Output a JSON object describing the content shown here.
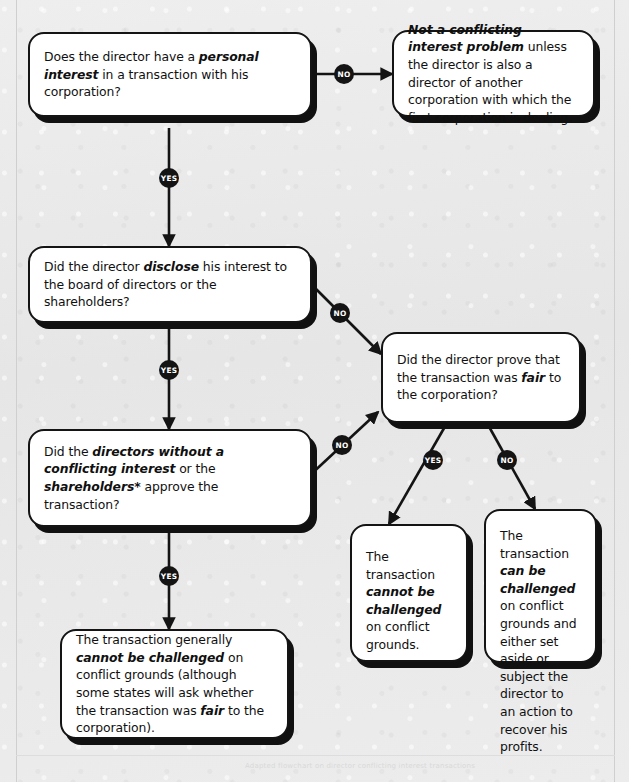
{
  "diagram": {
    "background_color": "#e9e9e9",
    "node_fill": "#ffffff",
    "node_stroke": "#141414",
    "badge_fill": "#141414",
    "badge_text_color": "#ffffff"
  },
  "nodes": [
    {
      "id": "q1",
      "type": "decision",
      "segments": [
        {
          "text": "Does the director have a ",
          "bold": false
        },
        {
          "text": "personal interest",
          "bold": true
        },
        {
          "text": " in a transaction with his corporation?",
          "bold": false
        }
      ],
      "plain": "Does the director have a personal interest in a transaction with his corporation?"
    },
    {
      "id": "r1",
      "type": "outcome",
      "segments": [
        {
          "text": "Not a conflicting interest problem",
          "bold": true
        },
        {
          "text": " unless the director is also a director of another corporation with which the first corporation is dealing.",
          "bold": false
        }
      ],
      "plain": "Not a conflicting interest problem unless the director is also a director of another corporation with which the first corporation is dealing."
    },
    {
      "id": "q2",
      "type": "decision",
      "segments": [
        {
          "text": "Did the director ",
          "bold": false
        },
        {
          "text": "disclose",
          "bold": true
        },
        {
          "text": " his interest to the board of directors or the shareholders?",
          "bold": false
        }
      ],
      "plain": "Did the director disclose his interest to the board of directors or the shareholders?"
    },
    {
      "id": "q3",
      "type": "decision",
      "segments": [
        {
          "text": "Did the director prove that the transaction was ",
          "bold": false
        },
        {
          "text": "fair",
          "bold": true
        },
        {
          "text": " to the corporation?",
          "bold": false
        }
      ],
      "plain": "Did the director prove that the transaction was fair to the corporation?"
    },
    {
      "id": "q4",
      "type": "decision",
      "segments": [
        {
          "text": "Did the ",
          "bold": false
        },
        {
          "text": "directors without a conflicting interest",
          "bold": true
        },
        {
          "text": " or the ",
          "bold": false
        },
        {
          "text": "shareholders*",
          "bold": true
        },
        {
          "text": " approve the transaction?",
          "bold": false
        }
      ],
      "plain": "Did the directors without a conflicting interest or the shareholders* approve the transaction?"
    },
    {
      "id": "r2",
      "type": "outcome",
      "segments": [
        {
          "text": "The transaction ",
          "bold": false
        },
        {
          "text": "cannot be challenged",
          "bold": true
        },
        {
          "text": " on conflict grounds.",
          "bold": false
        }
      ],
      "plain": "The transaction cannot be challenged on conflict grounds."
    },
    {
      "id": "r3",
      "type": "outcome",
      "segments": [
        {
          "text": "The transaction ",
          "bold": false
        },
        {
          "text": "can be challenged",
          "bold": true
        },
        {
          "text": " on conflict grounds and either set aside or subject the director to an action to recover his profits.",
          "bold": false
        }
      ],
      "plain": "The transaction can be challenged on conflict grounds and either set aside or subject the director to an action to recover his profits."
    },
    {
      "id": "r4",
      "type": "outcome",
      "segments": [
        {
          "text": "The transaction generally ",
          "bold": false
        },
        {
          "text": "cannot be challenged",
          "bold": true
        },
        {
          "text": " on conflict grounds (although some states will ask whether the transaction was ",
          "bold": false
        },
        {
          "text": "fair",
          "bold": true
        },
        {
          "text": " to the corporation).",
          "bold": false
        }
      ],
      "plain": "The transaction generally cannot be challenged on conflict grounds (although some states will ask whether the transaction was fair to the corporation)."
    }
  ],
  "edges": [
    {
      "id": "e1",
      "from": "q1",
      "to": "r1",
      "label": "NO"
    },
    {
      "id": "e2",
      "from": "q1",
      "to": "q2",
      "label": "YES"
    },
    {
      "id": "e3",
      "from": "q2",
      "to": "q3",
      "label": "NO"
    },
    {
      "id": "e4",
      "from": "q2",
      "to": "q4",
      "label": "YES"
    },
    {
      "id": "e5",
      "from": "q4",
      "to": "q3",
      "label": "NO"
    },
    {
      "id": "e6",
      "from": "q4",
      "to": "r4",
      "label": "YES"
    },
    {
      "id": "e7",
      "from": "q3",
      "to": "r2",
      "label": "YES"
    },
    {
      "id": "e8",
      "from": "q3",
      "to": "r3",
      "label": "NO"
    }
  ],
  "labels": {
    "yes": "YES",
    "no": "NO"
  },
  "footnote": "Adapted flowchart on director conflicting interest transactions"
}
